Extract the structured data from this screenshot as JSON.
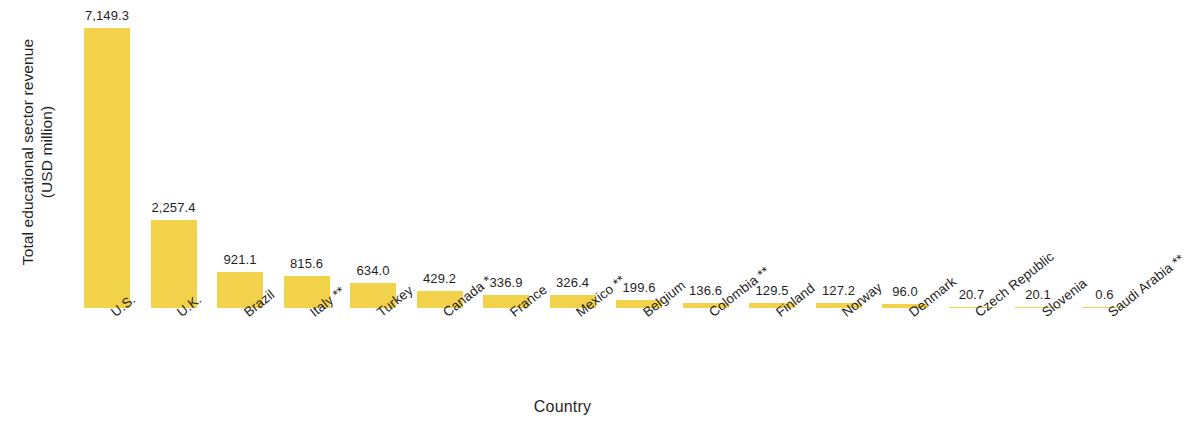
{
  "chart_data": {
    "type": "bar",
    "title": "",
    "xlabel": "Country",
    "ylabel": "Total educational sector revenue (USD million)",
    "ylabel_line1": "Total educational sector revenue",
    "ylabel_line2": "(USD million)",
    "ylim": [
      0,
      7149.3
    ],
    "grid": false,
    "legend": false,
    "bar_color": "#F2D24B",
    "categories": [
      "U.S.",
      "U.K.",
      "Brazil",
      "Italy **",
      "Turkey",
      "Canada *",
      "France",
      "Mexico **",
      "Belgium",
      "Colombia **",
      "Finland",
      "Norway",
      "Denmark",
      "Czech Republic",
      "Slovenia",
      "Saudi Arabia **"
    ],
    "values": [
      7149.3,
      2257.4,
      921.1,
      815.6,
      634.0,
      429.2,
      336.9,
      326.4,
      199.6,
      136.6,
      129.5,
      127.2,
      96.0,
      20.7,
      20.1,
      0.6
    ],
    "value_labels": [
      "7,149.3",
      "2,257.4",
      "921.1",
      "815.6",
      "634.0",
      "429.2",
      "336.9",
      "326.4",
      "199.6",
      "136.6",
      "129.5",
      "127.2",
      "96.0",
      "20.7",
      "20.1",
      "0.6"
    ]
  }
}
